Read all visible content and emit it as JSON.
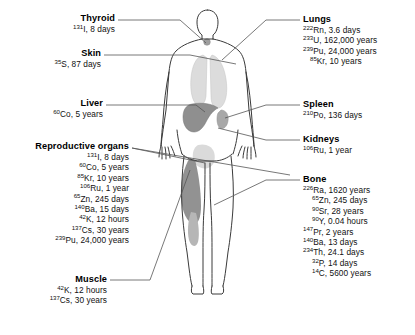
{
  "figure": {
    "body_outline_color": "#3a3a3a",
    "organ_fill_light": "#dcdcdc",
    "organ_fill_mid": "#b4b4b4",
    "organ_fill_dark": "#8a8a8a",
    "leader_color": "#555555",
    "caption": ""
  },
  "left_column": [
    {
      "organ": "Thyroid",
      "isotopes": [
        {
          "mass": "131",
          "symbol": "I",
          "halflife": ", 8 days"
        }
      ]
    },
    {
      "organ": "Skin",
      "isotopes": [
        {
          "mass": "35",
          "symbol": "S",
          "halflife": ", 87 days"
        }
      ]
    },
    {
      "organ": "Liver",
      "isotopes": [
        {
          "mass": "60",
          "symbol": "Co",
          "halflife": ", 5 years"
        }
      ]
    },
    {
      "organ": "Reproductive organs",
      "isotopes": [
        {
          "mass": "131",
          "symbol": "I",
          "halflife": ", 8 days"
        },
        {
          "mass": "60",
          "symbol": "Co",
          "halflife": ", 5 years"
        },
        {
          "mass": "85",
          "symbol": "Kr",
          "halflife": ", 10 years"
        },
        {
          "mass": "106",
          "symbol": "Ru",
          "halflife": ", 1 year"
        },
        {
          "mass": "65",
          "symbol": "Zn",
          "halflife": ", 245 days"
        },
        {
          "mass": "140",
          "symbol": "Ba",
          "halflife": ", 15 days"
        },
        {
          "mass": "42",
          "symbol": "K",
          "halflife": ", 12 hours"
        },
        {
          "mass": "137",
          "symbol": "Cs",
          "halflife": ", 30 years"
        },
        {
          "mass": "239",
          "symbol": "Pu",
          "halflife": ", 24,000 years"
        }
      ]
    },
    {
      "organ": "Muscle",
      "isotopes": [
        {
          "mass": "42",
          "symbol": "K",
          "halflife": ", 12 hours"
        },
        {
          "mass": "137",
          "symbol": "Cs",
          "halflife": ", 30 years"
        }
      ]
    }
  ],
  "right_column": [
    {
      "organ": "Lungs",
      "isotopes": [
        {
          "mass": "222",
          "symbol": "Rn",
          "halflife": ", 3.6 days"
        },
        {
          "mass": "233",
          "symbol": "U",
          "halflife": ", 162,000 years"
        },
        {
          "mass": "239",
          "symbol": "Pu",
          "halflife": ", 24,000 years"
        },
        {
          "mass": "85",
          "symbol": "Kr",
          "halflife": ", 10 years"
        }
      ]
    },
    {
      "organ": "Spleen",
      "isotopes": [
        {
          "mass": "210",
          "symbol": "Po",
          "halflife": ", 136 days"
        }
      ]
    },
    {
      "organ": "Kidneys",
      "isotopes": [
        {
          "mass": "106",
          "symbol": "Ru",
          "halflife": ", 1 year"
        }
      ]
    },
    {
      "organ": "Bone",
      "isotopes": [
        {
          "mass": "226",
          "symbol": "Ra",
          "halflife": ", 1620 years"
        },
        {
          "mass": "65",
          "symbol": "Zn",
          "halflife": ", 245 days"
        },
        {
          "mass": "90",
          "symbol": "Sr",
          "halflife": ", 28 years"
        },
        {
          "mass": "90",
          "symbol": "Y",
          "halflife": ", 0.04 hours"
        },
        {
          "mass": "147",
          "symbol": "Pr",
          "halflife": ", 2 years"
        },
        {
          "mass": "140",
          "symbol": "Ba",
          "halflife": ", 13 days"
        },
        {
          "mass": "234",
          "symbol": "Th",
          "halflife": ", 24.1 days"
        },
        {
          "mass": "32",
          "symbol": "P",
          "halflife": ", 14 days"
        },
        {
          "mass": "14",
          "symbol": "C",
          "halflife": ", 5600 years"
        }
      ]
    }
  ]
}
